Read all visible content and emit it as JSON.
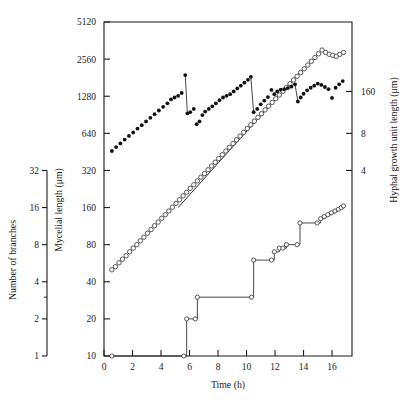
{
  "figure": {
    "background": "#ffffff",
    "ink_color": "#1a1a1a",
    "width": 412,
    "height": 403
  },
  "axes": {
    "x": {
      "title": "Time (h)",
      "ticks": [
        "0",
        "2",
        "4",
        "6",
        "8",
        "10",
        "12",
        "14",
        "16"
      ],
      "min": 0,
      "max": 17.4
    },
    "y_left_outer": {
      "title": "Number of branches",
      "ticks": [
        "32",
        "16",
        "8",
        "4",
        "2",
        "1"
      ],
      "scale": "log2",
      "min": 1,
      "max": 32
    },
    "y_left_inner": {
      "title": "Mycelial length (μm)",
      "ticks": [
        "5120",
        "2560",
        "1280",
        "640",
        "320",
        "160",
        "80",
        "40",
        "20",
        "10"
      ],
      "scale": "log2",
      "min": 10,
      "max": 5120
    },
    "y_right": {
      "title": "Hyphal growth unit length (μm)",
      "ticks": [
        "160",
        "8",
        "4"
      ],
      "scale": "log2"
    }
  },
  "chart_data": {
    "type": "scatter",
    "title": "",
    "subtitle": "",
    "xlabel": "Time (h)",
    "ylabel": "Mycelial length (μm)",
    "y2label": "Hyphal growth unit length (μm)",
    "y3label": "Number of branches",
    "grid": false,
    "legend_position": "none",
    "xlim": [
      0,
      17.4
    ],
    "ylim": [
      10,
      5120
    ],
    "yscale": "log2",
    "series": [
      {
        "name": "Hyphal growth unit length",
        "marker": "filled-circle",
        "axis": "right",
        "connected": true,
        "x": [
          0.55,
          0.85,
          1.15,
          1.45,
          1.75,
          2.05,
          2.35,
          2.65,
          2.95,
          3.25,
          3.55,
          3.85,
          4.15,
          4.45,
          4.7,
          4.95,
          5.2,
          5.45,
          5.7,
          5.85,
          6.05,
          6.3,
          6.5,
          6.7,
          6.9,
          7.1,
          7.35,
          7.6,
          7.85,
          8.1,
          8.35,
          8.6,
          8.85,
          9.1,
          9.35,
          9.6,
          9.85,
          10.1,
          10.3,
          10.5,
          10.75,
          11.0,
          11.25,
          11.5,
          11.75,
          11.95,
          12.15,
          12.4,
          12.65,
          12.9,
          13.15,
          13.4,
          13.6,
          13.8,
          14.0,
          14.25,
          14.5,
          14.75,
          15.0,
          15.25,
          15.5,
          15.75,
          16.0,
          16.25,
          16.5,
          16.75
        ],
        "y": [
          460,
          495,
          530,
          570,
          610,
          650,
          700,
          745,
          800,
          855,
          915,
          980,
          1050,
          1120,
          1205,
          1250,
          1290,
          1360,
          1900,
          930,
          950,
          1010,
          760,
          800,
          900,
          960,
          1010,
          1060,
          1120,
          1190,
          1250,
          1290,
          1330,
          1400,
          1480,
          1560,
          1650,
          1740,
          1840,
          950,
          1010,
          1100,
          1180,
          1260,
          1440,
          1330,
          1400,
          1450,
          1460,
          1490,
          1530,
          1600,
          1160,
          1250,
          1340,
          1430,
          1500,
          1560,
          1620,
          1580,
          1520,
          1460,
          1240,
          1500,
          1600,
          1700
        ]
      },
      {
        "name": "Mycelial length",
        "marker": "open-circle",
        "axis": "left",
        "connected": false,
        "x": [
          0.55,
          0.8,
          1.05,
          1.3,
          1.55,
          1.8,
          2.05,
          2.3,
          2.55,
          2.8,
          3.05,
          3.3,
          3.55,
          3.8,
          4.05,
          4.3,
          4.55,
          4.8,
          5.05,
          5.3,
          5.55,
          5.8,
          6.05,
          6.3,
          6.55,
          6.8,
          7.05,
          7.3,
          7.55,
          7.8,
          8.05,
          8.3,
          8.55,
          8.8,
          9.05,
          9.3,
          9.55,
          9.8,
          10.05,
          10.3,
          10.55,
          10.8,
          11.05,
          11.3,
          11.55,
          11.8,
          12.05,
          12.3,
          12.55,
          12.8,
          13.05,
          13.3,
          13.55,
          13.8,
          14.05,
          14.3,
          14.55,
          14.8,
          15.05,
          15.3,
          15.55,
          15.8,
          16.05,
          16.3,
          16.55,
          16.8
        ],
        "y": [
          50,
          53,
          57,
          61,
          65,
          70,
          75,
          80,
          86,
          92,
          99,
          106,
          114,
          122,
          131,
          140,
          150,
          161,
          173,
          185,
          199,
          213,
          229,
          245,
          263,
          282,
          302,
          324,
          348,
          373,
          400,
          429,
          460,
          493,
          529,
          567,
          608,
          652,
          699,
          750,
          804,
          862,
          924,
          991,
          1063,
          1140,
          1222,
          1310,
          1405,
          1507,
          1616,
          1733,
          1858,
          1993,
          2137,
          2292,
          2458,
          2636,
          2827,
          3032,
          2900,
          2800,
          2750,
          2700,
          2800,
          2900
        ],
        "fit_line": {
          "x0": 5.2,
          "y0": 160,
          "x1": 13.9,
          "y1": 2100
        }
      },
      {
        "name": "Number of branches",
        "marker": "open-circle-step",
        "axis": "left-outer",
        "connected": true,
        "step": true,
        "x": [
          0.55,
          5.6,
          5.8,
          6.4,
          6.55,
          10.35,
          10.5,
          11.75,
          11.95,
          12.3,
          12.55,
          12.8,
          13.55,
          13.75,
          14.95,
          15.2,
          15.45,
          15.7,
          15.95,
          16.2,
          16.45,
          16.65,
          16.8
        ],
        "y": [
          1,
          1,
          2,
          2,
          3,
          3,
          6,
          6,
          7,
          7.5,
          7.5,
          8,
          8,
          12,
          12,
          13,
          13.5,
          14,
          14.5,
          15,
          15.5,
          16,
          16.5
        ]
      }
    ]
  }
}
